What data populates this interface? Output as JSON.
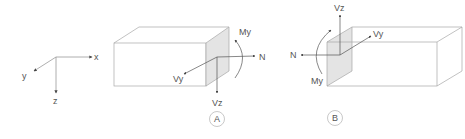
{
  "colors": {
    "line": "#9a9a9a",
    "text": "#555555",
    "face": "#e4e4e4",
    "arrow": "#444444"
  },
  "axes": {
    "x_label": "x",
    "y_label": "y",
    "z_label": "z"
  },
  "panel_a": {
    "label": "A",
    "forces": {
      "n": "N",
      "vy": "Vy",
      "vz": "Vz",
      "my": "My"
    }
  },
  "panel_b": {
    "label": "B",
    "forces": {
      "n": "N",
      "vy": "Vy",
      "vz": "Vz",
      "my": "My"
    }
  }
}
